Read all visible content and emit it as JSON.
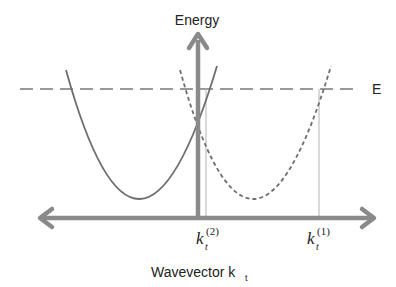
{
  "diagram": {
    "title": "",
    "y_axis_label": "Energy",
    "x_axis_label": "Wavevector k",
    "x_axis_label_subscript": "t",
    "energy_level_label": "E",
    "k_markers": [
      {
        "base": "k",
        "subscript": "t",
        "superscript": "(2)"
      },
      {
        "base": "k",
        "subscript": "t",
        "superscript": "(1)"
      }
    ],
    "curves": [
      {
        "name": "solid-parabola",
        "style": "solid",
        "vertex_x": 138,
        "vertex_y": 200
      },
      {
        "name": "dashed-parabola",
        "style": "dashed",
        "vertex_x": 252,
        "vertex_y": 200
      }
    ],
    "colors": {
      "axis": "#8a8a8a",
      "curve": "#6e6e6e",
      "energy_line": "#9a9a9a",
      "marker_line": "#c0c0c0",
      "text": "#222222"
    }
  }
}
